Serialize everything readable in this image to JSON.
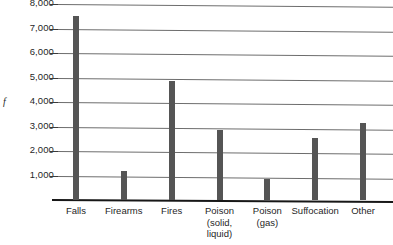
{
  "chart_data": {
    "type": "bar",
    "title": "",
    "subtitle": "",
    "xlabel": "",
    "ylabel": "f",
    "ylim": [
      0,
      8000
    ],
    "grid": true,
    "legend": null,
    "categories": [
      "Falls",
      "Firearms",
      "Fires",
      "Poison\n(solid,\nliquid)",
      "Poison\n(gas)",
      "Suffocation",
      "Other"
    ],
    "values": [
      7500,
      1200,
      4850,
      2850,
      850,
      2550,
      3150
    ],
    "ytick_labels": [
      "1,000",
      "2,000",
      "3,000",
      "4,000",
      "5,000",
      "6,000",
      "7,000",
      "8,000"
    ],
    "ytick_values": [
      1000,
      2000,
      3000,
      4000,
      5000,
      6000,
      7000,
      8000
    ],
    "colors": {
      "bar": "#555555",
      "gridline": "#6d6d6d",
      "axis": "#171717",
      "text": "#1f1f1f",
      "background": "#ffffff"
    }
  }
}
